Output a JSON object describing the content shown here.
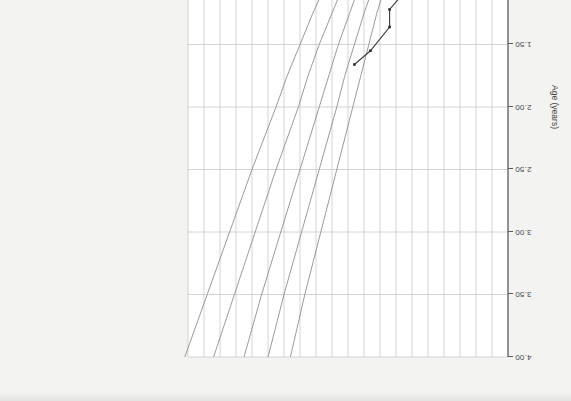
{
  "chart_data": {
    "type": "line",
    "title": "",
    "subtitle": "",
    "xlabel": "Age (years)",
    "ylabel": "Weight (kg)",
    "xlim": [
      0.0,
      4.0
    ],
    "ylim": [
      0.0,
      20.0
    ],
    "xticks": [
      "0.00",
      "0.50",
      "1.00",
      "1.50",
      "2.00",
      "2.50",
      "3.00",
      "3.50",
      "4.00"
    ],
    "xtick_values": [
      0.0,
      0.5,
      1.0,
      1.5,
      2.0,
      2.5,
      3.0,
      3.5,
      4.0
    ],
    "yticks": [
      "0",
      "1.0",
      "2.0",
      "3.0",
      "4.0",
      "5.0",
      "6.0",
      "7.0",
      "8.0",
      "9.0",
      "10.0",
      "11.0",
      "12.0",
      "13.0",
      "14.0",
      "15.0",
      "16.0",
      "17.0",
      "18.0",
      "19.0",
      "20.0"
    ],
    "ytick_values": [
      0,
      1,
      2,
      3,
      4,
      5,
      6,
      7,
      8,
      9,
      10,
      11,
      12,
      13,
      14,
      15,
      16,
      17,
      18,
      19,
      20
    ],
    "grid": true,
    "legend_position": "none",
    "rotation_degrees": 180,
    "series": [
      {
        "name": "percentile-97",
        "kind": "reference-curve",
        "color": "#8f8f8f",
        "x": [
          0.0,
          0.08,
          0.17,
          0.25,
          0.33,
          0.5,
          0.67,
          0.83,
          1.0,
          1.25,
          1.5,
          1.75,
          2.0,
          2.5,
          3.0,
          3.5,
          4.0
        ],
        "y": [
          4.3,
          5.3,
          6.4,
          7.2,
          7.9,
          9.0,
          9.9,
          10.6,
          11.3,
          12.2,
          13.0,
          13.8,
          14.5,
          16.0,
          17.4,
          18.8,
          20.2
        ]
      },
      {
        "name": "percentile-85",
        "kind": "reference-curve",
        "color": "#8f8f8f",
        "x": [
          0.0,
          0.08,
          0.17,
          0.25,
          0.33,
          0.5,
          0.67,
          0.83,
          1.0,
          1.25,
          1.5,
          1.75,
          2.0,
          2.5,
          3.0,
          3.5,
          4.0
        ],
        "y": [
          3.9,
          4.8,
          5.8,
          6.5,
          7.1,
          8.1,
          8.9,
          9.6,
          10.2,
          11.0,
          11.8,
          12.5,
          13.1,
          14.5,
          15.8,
          17.1,
          18.4
        ]
      },
      {
        "name": "percentile-50",
        "kind": "reference-curve",
        "color": "#8f8f8f",
        "x": [
          0.0,
          0.08,
          0.17,
          0.25,
          0.33,
          0.5,
          0.67,
          0.83,
          1.0,
          1.25,
          1.5,
          1.75,
          2.0,
          2.5,
          3.0,
          3.5,
          4.0
        ],
        "y": [
          3.5,
          4.3,
          5.2,
          5.8,
          6.4,
          7.3,
          8.0,
          8.6,
          9.2,
          9.9,
          10.6,
          11.2,
          11.8,
          13.0,
          14.2,
          15.4,
          16.5
        ]
      },
      {
        "name": "percentile-15",
        "kind": "reference-curve",
        "color": "#8f8f8f",
        "x": [
          0.0,
          0.08,
          0.17,
          0.25,
          0.33,
          0.5,
          0.67,
          0.83,
          1.0,
          1.25,
          1.5,
          1.75,
          2.0,
          2.5,
          3.0,
          3.5,
          4.0
        ],
        "y": [
          3.2,
          3.9,
          4.7,
          5.3,
          5.8,
          6.6,
          7.2,
          7.8,
          8.3,
          9.0,
          9.6,
          10.2,
          10.7,
          11.8,
          12.9,
          14.0,
          15.0
        ]
      },
      {
        "name": "percentile-3",
        "kind": "reference-curve",
        "color": "#8f8f8f",
        "x": [
          0.0,
          0.08,
          0.17,
          0.25,
          0.33,
          0.5,
          0.67,
          0.83,
          1.0,
          1.25,
          1.5,
          1.75,
          2.0,
          2.5,
          3.0,
          3.5,
          4.0
        ],
        "y": [
          2.9,
          3.5,
          4.2,
          4.8,
          5.2,
          6.0,
          6.6,
          7.1,
          7.6,
          8.2,
          8.7,
          9.2,
          9.7,
          10.7,
          11.7,
          12.7,
          13.6
        ]
      },
      {
        "name": "patient-weight",
        "kind": "measured",
        "color": "#2e2e2e",
        "marker": true,
        "x": [
          0.02,
          0.05,
          0.07,
          0.1,
          0.14,
          0.18,
          0.22,
          0.27,
          0.32,
          0.36,
          0.4,
          0.45,
          0.52,
          0.6,
          0.68,
          0.74,
          0.8,
          0.86,
          0.92,
          1.0,
          1.1,
          1.22,
          1.36,
          1.55,
          1.66
        ],
        "y": [
          3.4,
          3.6,
          3.8,
          4.0,
          4.2,
          4.3,
          4.5,
          4.6,
          4.8,
          4.9,
          5.0,
          5.2,
          5.3,
          5.3,
          5.5,
          5.8,
          5.9,
          6.0,
          6.1,
          6.2,
          6.6,
          7.4,
          7.4,
          8.6,
          9.6
        ]
      }
    ]
  }
}
